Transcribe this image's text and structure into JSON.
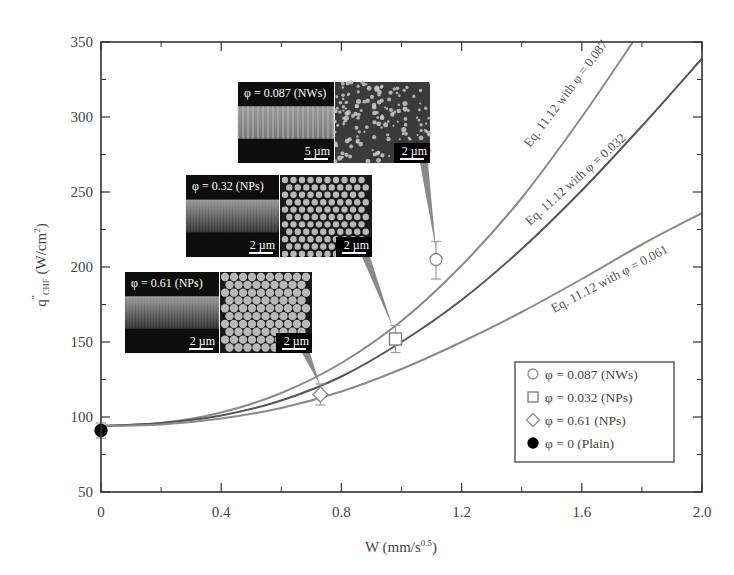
{
  "chart_data": {
    "type": "scatter",
    "title": "",
    "xlabel": "W (mm/s^0.5)",
    "xlabel_main": "W (mm/s",
    "xlabel_sup": "0.5",
    "xlabel_end": ")",
    "ylabel": "q\"_CHF (W/cm^2)",
    "ylabel_q": "q",
    "ylabel_sub": "CHF",
    "ylabel_unit": "(W/cm",
    "ylabel_sup": "2",
    "ylabel_end": ")",
    "xlim": [
      0,
      2.0
    ],
    "ylim": [
      50,
      350
    ],
    "x_ticks": [
      0,
      0.4,
      0.8,
      1.2,
      1.6,
      2.0
    ],
    "x_tick_labels": [
      "0",
      "0.4",
      "0.8",
      "1.2",
      "1.6",
      "2.0"
    ],
    "x_minor_ticks": [
      0.2,
      0.6,
      1.0,
      1.4,
      1.8
    ],
    "y_ticks": [
      50,
      100,
      150,
      200,
      250,
      300,
      350
    ],
    "y_tick_labels": [
      "50",
      "100",
      "150",
      "200",
      "250",
      "300",
      "350"
    ],
    "y_minor_ticks": [
      75,
      125,
      175,
      225,
      275,
      325
    ],
    "grid": false,
    "legend_position": "lower right",
    "series": [
      {
        "name": "φ = 0.087 (NWs)",
        "marker": "circle-open",
        "x": [
          1.115
        ],
        "y": [
          205
        ],
        "yerr_low": [
          192
        ],
        "yerr_high": [
          217
        ]
      },
      {
        "name": "φ = 0.032 (NPs)",
        "marker": "square-open",
        "x": [
          0.98
        ],
        "y": [
          152
        ],
        "yerr_low": [
          143
        ],
        "yerr_high": [
          161
        ]
      },
      {
        "name": "φ = 0.61 (NPs)",
        "marker": "diamond-open",
        "x": [
          0.73
        ],
        "y": [
          115
        ],
        "yerr_low": [
          108
        ],
        "yerr_high": [
          122
        ]
      },
      {
        "name": "φ = 0 (Plain)",
        "marker": "circle-filled",
        "x": [
          0
        ],
        "y": [
          91
        ],
        "yerr_low": [
          86
        ],
        "yerr_high": [
          96
        ]
      }
    ],
    "curves": [
      {
        "name": "Eq. 11.12 with φ = 0.087",
        "x": [
          0,
          0.2,
          0.4,
          0.6,
          0.8,
          1.0,
          1.2,
          1.4,
          1.6,
          1.77
        ],
        "y": [
          94,
          96,
          103,
          116,
          136,
          164,
          201,
          246,
          300,
          350
        ],
        "color": "#8a8a8a"
      },
      {
        "name": "Eq. 11.12 with φ = 0.032",
        "x": [
          0,
          0.2,
          0.4,
          0.6,
          0.8,
          1.0,
          1.2,
          1.4,
          1.6,
          1.8,
          2.0
        ],
        "y": [
          94,
          96,
          101,
          111,
          127,
          150,
          178,
          212,
          251,
          294,
          339
        ],
        "color": "#555555"
      },
      {
        "name": "Eq. 11.12 with φ = 0.061",
        "x": [
          0,
          0.2,
          0.4,
          0.6,
          0.8,
          1.0,
          1.2,
          1.4,
          1.6,
          1.8,
          2.0
        ],
        "y": [
          94,
          95,
          99,
          106,
          117,
          132,
          150,
          170,
          192,
          215,
          236
        ],
        "color": "#8a8a8a"
      }
    ],
    "annotations": [
      {
        "text": "Eq. 11.12 with φ = 0.087",
        "x": 530,
        "y": 148,
        "angle": -53
      },
      {
        "text": "Eq. 11.12 with φ = 0.032",
        "x": 530,
        "y": 226,
        "angle": -42
      },
      {
        "text": "Eq. 11.12 with φ = 0.061",
        "x": 554,
        "y": 313,
        "angle": -28
      }
    ],
    "insets": [
      {
        "caption": "φ = 0.087 (NWs)",
        "left_scale": "5 µm",
        "right_scale": "2 µm",
        "pattern": "nanowires",
        "x": 238,
        "y": 82,
        "w": 192,
        "h": 81,
        "pointer_to": [
          436,
          250
        ]
      },
      {
        "caption": "φ = 0.32 (NPs)",
        "left_scale": "2 µm",
        "right_scale": "2 µm",
        "pattern": "dots-sparse",
        "x": 186,
        "y": 175,
        "w": 186,
        "h": 82,
        "pointer_to": [
          393,
          328
        ]
      },
      {
        "caption": "φ = 0.61 (NPs)",
        "left_scale": "2 µm",
        "right_scale": "2 µm",
        "pattern": "dots-dense",
        "x": 125,
        "y": 272,
        "w": 187,
        "h": 81,
        "pointer_to": [
          320,
          385
        ]
      }
    ]
  },
  "legend": {
    "items": [
      {
        "label": "φ = 0.087 (NWs)",
        "marker": "circle-open"
      },
      {
        "label": "φ = 0.032 (NPs)",
        "marker": "square-open"
      },
      {
        "label": "φ = 0.61 (NPs)",
        "marker": "diamond-open"
      },
      {
        "label": "φ = 0 (Plain)",
        "marker": "circle-filled"
      }
    ]
  }
}
